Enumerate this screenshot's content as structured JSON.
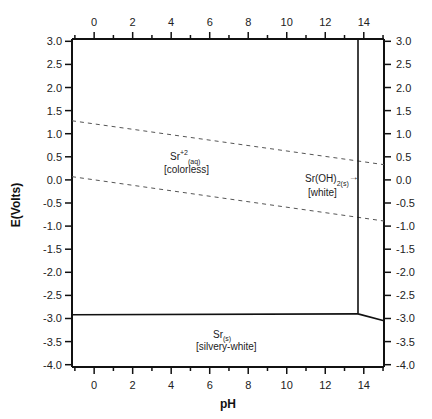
{
  "chart_data": {
    "type": "line",
    "title": "",
    "xlabel": "pH",
    "ylabel": "E(Volts)",
    "xlim": [
      -1.15,
      15.05
    ],
    "ylim": [
      -4.05,
      3.05
    ],
    "grid": false,
    "legend": null,
    "x_ticks": [
      0,
      2,
      4,
      6,
      8,
      10,
      12,
      14
    ],
    "x_tick_labels": [
      "0",
      "2",
      "4",
      "6",
      "8",
      "10",
      "12",
      "14"
    ],
    "x_minor_ticks": [
      -1,
      1,
      3,
      5,
      7,
      9,
      11,
      13,
      15
    ],
    "y_ticks": [
      3.0,
      2.5,
      2.0,
      1.5,
      1.0,
      0.5,
      0.0,
      -0.5,
      -1.0,
      -1.5,
      -2.0,
      -2.5,
      -3.0,
      -3.5,
      -4.0
    ],
    "y_tick_labels": [
      "3.0",
      "2.5",
      "2.0",
      "1.5",
      "1.0",
      "0.5",
      "0.0",
      "-0.5",
      "-1.0",
      "-1.5",
      "-2.0",
      "-2.5",
      "-3.0",
      "-3.5",
      "-4.0"
    ],
    "mirrored_axes": "top x-axis and right y-axis repeat the same tick labels",
    "series": [
      {
        "name": "O2/H2O water stability limit",
        "style": "dashed",
        "x": [
          -1.15,
          15.05
        ],
        "y": [
          1.28,
          0.33
        ]
      },
      {
        "name": "H+/H2 water stability limit",
        "style": "dashed",
        "x": [
          -1.15,
          15.05
        ],
        "y": [
          0.07,
          -0.89
        ]
      },
      {
        "name": "Sr+2 / Sr(s) boundary",
        "style": "solid",
        "x": [
          -1.15,
          13.7
        ],
        "y": [
          -2.92,
          -2.9
        ]
      },
      {
        "name": "Sr+2 / Sr(OH)2 boundary",
        "style": "solid",
        "x": [
          13.7,
          13.7
        ],
        "y": [
          3.05,
          -2.9
        ]
      },
      {
        "name": "Sr(OH)2 / Sr(s) boundary",
        "style": "solid",
        "x": [
          13.7,
          15.05
        ],
        "y": [
          -2.9,
          -3.05
        ]
      }
    ],
    "annotations": [
      {
        "species": "Sr",
        "superscript": "+2",
        "subscript": "(aq)",
        "description": "[colorless]",
        "x": 5.2,
        "y": 0.4
      },
      {
        "species": "Sr(OH)",
        "subscript": "2(s)",
        "arrow": "→",
        "description": "[white]",
        "x": 12.3,
        "y": 0.0
      },
      {
        "species": "Sr",
        "subscript": "(s)",
        "description": "[silvery-white]",
        "x": 7.0,
        "y": -3.5
      }
    ]
  },
  "labels": {
    "xlabel": "pH",
    "ylabel": "E(Volts)",
    "sr2": {
      "main": "Sr",
      "sup": "+2",
      "sub": "(aq)",
      "desc": "[colorless]"
    },
    "sroh": {
      "main": "Sr(OH)",
      "sub": "2(s)",
      "arrow": "→",
      "desc": "[white]"
    },
    "srs": {
      "main": "Sr",
      "sub": "(s)",
      "desc": "[silvery-white]"
    }
  },
  "colors": {
    "line": "#111111",
    "dashed": "#555555",
    "background": "#ffffff"
  }
}
